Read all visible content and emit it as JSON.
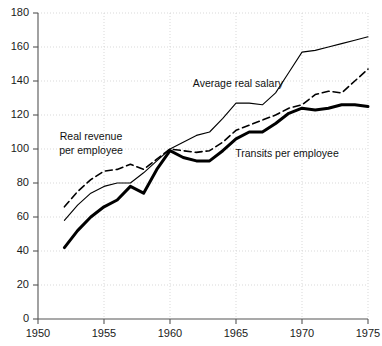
{
  "chart_data": {
    "type": "line",
    "title": "",
    "subtitle": "",
    "xlabel": "",
    "ylabel": "",
    "xlim": [
      1950,
      1975
    ],
    "ylim": [
      0,
      180
    ],
    "x": [
      1952,
      1953,
      1954,
      1955,
      1956,
      1957,
      1958,
      1959,
      1960,
      1961,
      1962,
      1963,
      1964,
      1965,
      1966,
      1967,
      1968,
      1969,
      1970,
      1971,
      1972,
      1973,
      1974,
      1975
    ],
    "grid": true,
    "grid_axis": "both",
    "legend_position": "inline-annotations",
    "x_ticks": [
      1950,
      1955,
      1960,
      1965,
      1970,
      1975
    ],
    "x_tick_labels": [
      "1950",
      "1955",
      "1960",
      "1965",
      "1970",
      "1975"
    ],
    "y_ticks": [
      0,
      20,
      40,
      60,
      80,
      100,
      120,
      140,
      160,
      180
    ],
    "y_tick_labels": [
      "0",
      "20",
      "40",
      "60",
      "80",
      "100",
      "120",
      "140",
      "160",
      "180"
    ],
    "series": [
      {
        "name": "Average real salary",
        "style": "thin-solid",
        "color": "#000000",
        "width": 1.1,
        "values": [
          58,
          67,
          74,
          78,
          80,
          80,
          86,
          93,
          100,
          104,
          108,
          110,
          118,
          127,
          127,
          126,
          133,
          145,
          157,
          158,
          160,
          162,
          164,
          166
        ]
      },
      {
        "name": "Real revenue per employee",
        "style": "dashed",
        "color": "#000000",
        "width": 1.6,
        "values": [
          66,
          75,
          82,
          87,
          88,
          91,
          88,
          94,
          100,
          99,
          98,
          99,
          104,
          111,
          114,
          117,
          120,
          124,
          126,
          132,
          134,
          133,
          140,
          147
        ]
      },
      {
        "name": "Transits per employee",
        "style": "thick-solid",
        "color": "#000000",
        "width": 3.0,
        "values": [
          42,
          52,
          60,
          66,
          70,
          78,
          74,
          88,
          99,
          95,
          93,
          93,
          99,
          106,
          110,
          110,
          115,
          121,
          124,
          123,
          124,
          126,
          126,
          125
        ]
      }
    ],
    "annotations": [
      {
        "text": "Real revenue",
        "x_px": 91,
        "y_px": 140
      },
      {
        "text": "per employee",
        "x_px": 91,
        "y_px": 154
      },
      {
        "text": "Average real salary",
        "x_px": 238,
        "y_px": 87
      },
      {
        "text": "Transits per employee",
        "x_px": 287,
        "y_px": 157
      }
    ]
  },
  "colors": {
    "axis": "#555555",
    "grid": "#cfcfcf",
    "text": "#1a1a1a",
    "series": "#000000",
    "background": "#ffffff"
  }
}
